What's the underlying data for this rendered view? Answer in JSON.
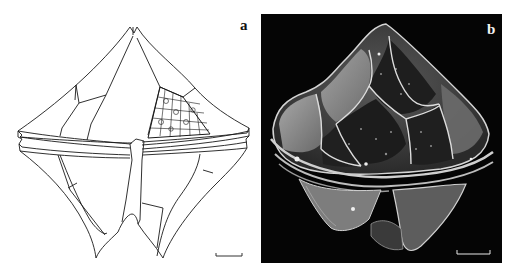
{
  "figure": {
    "panels": [
      {
        "id": "a",
        "label": "a",
        "type": "line drawing",
        "description": "Line drawing of a dinoflagellate cyst/theca in ventral view showing plate boundaries, cingulum band, sulcus, and reticulate ornamentation on one plate",
        "scale_bar": true
      },
      {
        "id": "b",
        "label": "b",
        "type": "SEM micrograph",
        "description": "Scanning electron micrograph of the dinoflagellate specimen on black background showing plate sutures and granular surface",
        "scale_bar": true
      }
    ]
  },
  "colors": {
    "background": "#ffffff",
    "drawing_stroke": "#1a1a1a",
    "sem_background": "#050505",
    "sem_surface": "#8a8a8a"
  }
}
